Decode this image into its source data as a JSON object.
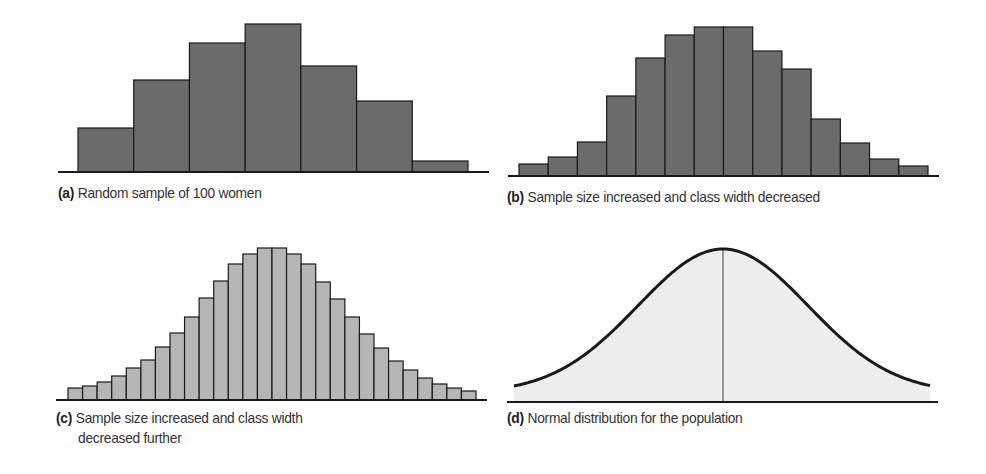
{
  "colors": {
    "dark_bar_fill": "#6b6b6b",
    "light_bar_fill": "#b5b5b5",
    "curve_fill": "#ededed",
    "stroke": "#1a1a1a",
    "mean_line": "#7a7a7a"
  },
  "panels": [
    {
      "id": "a",
      "label": "(a)",
      "caption": "Random sample of 100 women"
    },
    {
      "id": "b",
      "label": "(b)",
      "caption": "Sample size increased and class width decreased"
    },
    {
      "id": "c",
      "label": "(c)",
      "caption": "Sample size increased and class width",
      "caption_line2": "decreased further"
    },
    {
      "id": "d",
      "label": "(d)",
      "caption": "Normal distribution for the population"
    }
  ],
  "chart_data": [
    {
      "type": "bar",
      "title": "(a) Random sample of 100 women",
      "xlabel": "",
      "ylabel": "",
      "categories": [
        "1",
        "2",
        "3",
        "4",
        "5",
        "6",
        "7"
      ],
      "values": [
        44,
        92,
        129,
        148,
        106,
        71,
        11
      ],
      "units": "relative height (px)",
      "grid": false
    },
    {
      "type": "bar",
      "title": "(b) Sample size increased and class width decreased",
      "xlabel": "",
      "ylabel": "",
      "categories": [
        "1",
        "2",
        "3",
        "4",
        "5",
        "6",
        "7",
        "8",
        "9",
        "10",
        "11",
        "12",
        "13",
        "14"
      ],
      "values": [
        12,
        19,
        34,
        80,
        118,
        141,
        149,
        149,
        125,
        107,
        57,
        33,
        17,
        10
      ],
      "units": "relative height (px)",
      "grid": false
    },
    {
      "type": "bar",
      "title": "(c) Sample size increased and class width decreased further",
      "xlabel": "",
      "ylabel": "",
      "categories": [
        "1",
        "2",
        "3",
        "4",
        "5",
        "6",
        "7",
        "8",
        "9",
        "10",
        "11",
        "12",
        "13",
        "14",
        "15",
        "16",
        "17",
        "18",
        "19",
        "20",
        "21",
        "22",
        "23",
        "24",
        "25",
        "26",
        "27",
        "28"
      ],
      "values": [
        12,
        14,
        18,
        24,
        32,
        40,
        53,
        67,
        83,
        102,
        119,
        136,
        146,
        152,
        152,
        146,
        136,
        118,
        101,
        83,
        66,
        52,
        39,
        30,
        22,
        16,
        12,
        9
      ],
      "units": "relative height (px)",
      "grid": false
    },
    {
      "type": "area",
      "title": "(d) Normal distribution for the population",
      "xlabel": "",
      "ylabel": "",
      "distribution": "normal",
      "mean_line": true,
      "peak_height": 153,
      "grid": false
    }
  ]
}
